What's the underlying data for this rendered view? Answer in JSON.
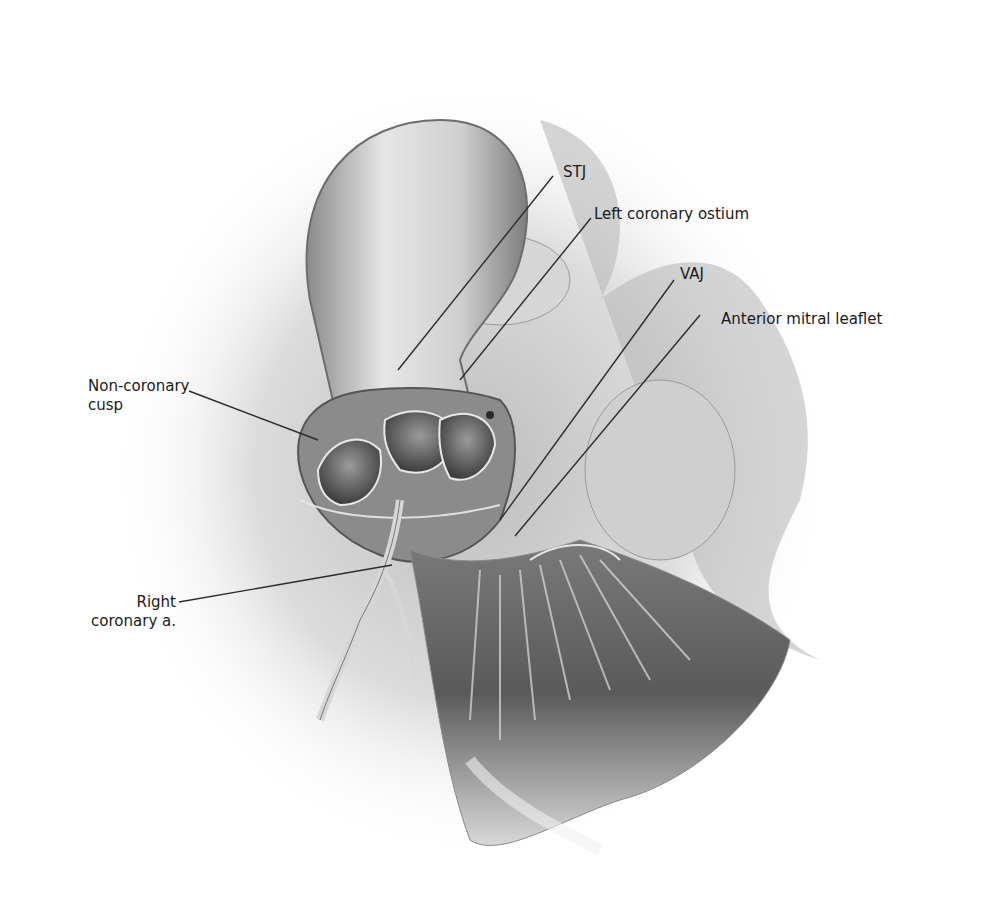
{
  "figure": {
    "labels": [
      {
        "id": "stj",
        "text": "STJ"
      },
      {
        "id": "left-coronary-ostium",
        "text": "Left coronary ostium"
      },
      {
        "id": "vaj",
        "text": "VAJ"
      },
      {
        "id": "anterior-mitral-leaflet",
        "text": "Anterior mitral leaflet"
      },
      {
        "id": "non-coronary-cusp",
        "line1": "Non-coronary",
        "line2": "cusp"
      },
      {
        "id": "right-coronary-a",
        "line1": "Right",
        "line2": "coronary a."
      }
    ]
  }
}
